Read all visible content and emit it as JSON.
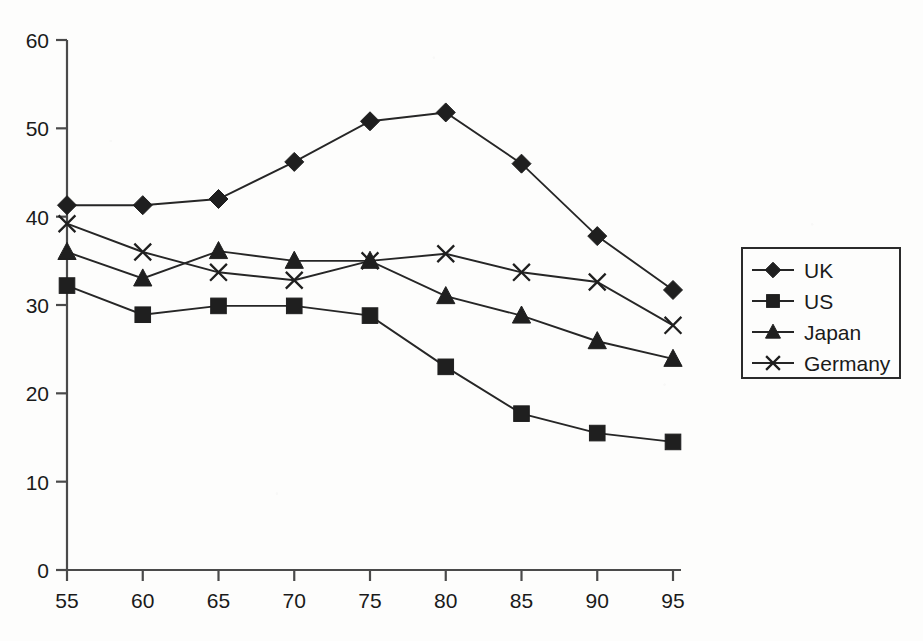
{
  "chart_data": {
    "type": "line",
    "title": "",
    "subtitle": "",
    "xlabel": "",
    "ylabel": "",
    "categories": [
      "55",
      "60",
      "65",
      "70",
      "75",
      "80",
      "85",
      "90",
      "95"
    ],
    "x": [
      55,
      60,
      65,
      70,
      75,
      80,
      85,
      90,
      95
    ],
    "xlim": [
      55,
      95
    ],
    "ylim": [
      0,
      60
    ],
    "y_ticks": [
      "0",
      "10",
      "20",
      "30",
      "40",
      "50",
      "60"
    ],
    "x_ticks": [
      "55",
      "60",
      "65",
      "70",
      "75",
      "80",
      "85",
      "90",
      "95"
    ],
    "grid": false,
    "legend_position": "right",
    "series": [
      {
        "name": "UK",
        "marker": "diamond",
        "values": [
          41.3,
          41.3,
          42.0,
          46.2,
          50.8,
          51.8,
          46.0,
          37.8,
          31.7
        ]
      },
      {
        "name": "US",
        "marker": "square",
        "values": [
          32.2,
          28.9,
          29.9,
          29.9,
          28.8,
          23.0,
          17.7,
          15.5,
          14.5
        ]
      },
      {
        "name": "Japan",
        "marker": "triangle",
        "values": [
          36.0,
          33.0,
          36.1,
          35.0,
          35.0,
          31.0,
          28.8,
          25.9,
          23.9
        ]
      },
      {
        "name": "Germany",
        "marker": "cross",
        "values": [
          39.2,
          36.0,
          33.7,
          32.8,
          35.0,
          35.8,
          33.7,
          32.6,
          27.7
        ]
      }
    ]
  },
  "colors": {
    "ink": "#1f1f1f",
    "axis": "#4a4a4a",
    "background": "#fdfdfc"
  },
  "legend": {
    "items": [
      {
        "label": "UK"
      },
      {
        "label": "US"
      },
      {
        "label": "Japan"
      },
      {
        "label": "Germany"
      }
    ]
  }
}
